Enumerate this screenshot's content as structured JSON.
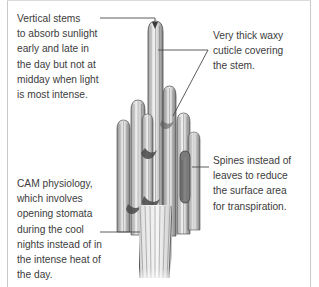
{
  "figure": {
    "background_color": "#ffffff",
    "text_color": "#3c3c3c",
    "leader_line_color": "#4a4a4a",
    "border_color": "#c9c9c9"
  },
  "callouts": {
    "vertical_stems": {
      "text": "Vertical stems\nto absorb sunlight\nearly and late in\nthe day but not at\nmidday when light\nis most intense."
    },
    "cuticle": {
      "text": "Very thick waxy\ncuticle covering\nthe stem."
    },
    "spines": {
      "text": "Spines instead of\nleaves to reduce\nthe surface area\nfor transpiration."
    },
    "cam": {
      "text": "CAM physiology,\nwhich involves\nopening stomata\nduring the cool\nnights instead of in\nthe intense heat of\nthe day."
    }
  },
  "illustration": {
    "name": "saguaro-cactus",
    "description": "Engraved line illustration of a multi-armed columnar saguaro cactus with vertical ribs"
  }
}
